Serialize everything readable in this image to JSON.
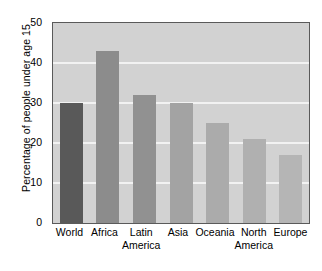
{
  "chart_data": {
    "type": "bar",
    "title": "",
    "subtitle": "",
    "xlabel": "",
    "ylabel": "Percentage of people under age 15",
    "categories": [
      "World",
      "Africa",
      "Latin America",
      "Asia",
      "Oceania",
      "North America",
      "Europe"
    ],
    "category_lines": [
      [
        "World",
        ""
      ],
      [
        "Africa",
        ""
      ],
      [
        "Latin",
        "America"
      ],
      [
        "Asia",
        ""
      ],
      [
        "Oceania",
        ""
      ],
      [
        "North",
        "America"
      ],
      [
        "Europe",
        ""
      ]
    ],
    "values": [
      30,
      43,
      32,
      30,
      25,
      21,
      17
    ],
    "bar_colors": [
      "#595959",
      "#8c8c8c",
      "#919191",
      "#a3a3a3",
      "#ababab",
      "#b0b0b0",
      "#b5b5b5"
    ],
    "ylim": [
      0,
      50
    ],
    "yticks": [
      0,
      10,
      20,
      30,
      40,
      50
    ],
    "ytick_labels": [
      "0",
      "10",
      "20",
      "30",
      "40",
      "50"
    ],
    "grid": true,
    "gridline_values": [
      10,
      20,
      30,
      40
    ],
    "gridline_color": "#f2f2f2",
    "plot_background": "#d2d2d2",
    "frame_color": "#5a5a5a",
    "legend": null
  }
}
